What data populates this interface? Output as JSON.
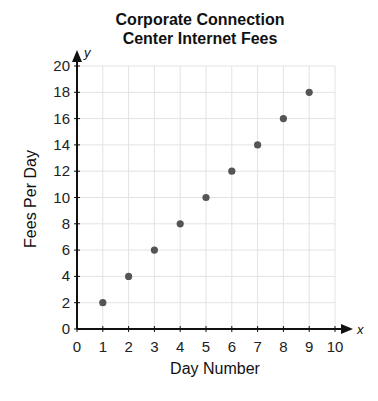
{
  "chart_data": {
    "type": "scatter",
    "title": "Corporate Connection Center Internet Fees",
    "title_lines": [
      "Corporate Connection",
      "Center Internet Fees"
    ],
    "xlabel": "Day Number",
    "ylabel": "Fees Per Day",
    "x_axis_symbol": "x",
    "y_axis_symbol": "y",
    "xlim": [
      0,
      10
    ],
    "ylim": [
      0,
      20
    ],
    "x_ticks": [
      0,
      1,
      2,
      3,
      4,
      5,
      6,
      7,
      8,
      9,
      10
    ],
    "y_ticks": [
      0,
      2,
      4,
      6,
      8,
      10,
      12,
      14,
      16,
      18,
      20
    ],
    "grid": true,
    "x": [
      1,
      2,
      3,
      4,
      5,
      6,
      7,
      8,
      9
    ],
    "y": [
      2,
      4,
      6,
      8,
      10,
      12,
      14,
      16,
      18
    ],
    "point_color": "#555555"
  }
}
